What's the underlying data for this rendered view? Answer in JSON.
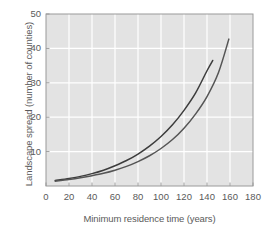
{
  "chart_data": {
    "type": "line",
    "title": "",
    "xlabel": "Minimum residence time (years)",
    "ylabel": "Landscape spread (number of counties)",
    "xlim": [
      0,
      180
    ],
    "ylim": [
      0,
      50
    ],
    "xticks": [
      0,
      20,
      40,
      60,
      80,
      100,
      120,
      140,
      160,
      180
    ],
    "yticks": [
      10,
      20,
      30,
      40,
      50
    ],
    "grid": true,
    "legend": "none",
    "background_color": "#e3e3e3",
    "gridline_color": "#ffffff",
    "axis_color": "#9a9a9a",
    "series": [
      {
        "name": "upper-curve",
        "color": "#3c3c3c",
        "x": [
          8,
          20,
          30,
          40,
          50,
          60,
          70,
          80,
          90,
          100,
          110,
          120,
          130,
          140,
          145
        ],
        "y": [
          1.6,
          2.2,
          2.8,
          3.6,
          4.6,
          5.9,
          7.4,
          9.3,
          11.6,
          14.4,
          17.8,
          22.0,
          27.0,
          33.5,
          36.5
        ]
      },
      {
        "name": "lower-curve",
        "color": "#555555",
        "x": [
          8,
          20,
          30,
          40,
          50,
          60,
          70,
          80,
          90,
          100,
          110,
          120,
          130,
          140,
          150,
          159
        ],
        "y": [
          1.4,
          1.9,
          2.4,
          3.0,
          3.7,
          4.6,
          5.7,
          7.1,
          8.8,
          10.9,
          13.5,
          16.8,
          20.9,
          26.0,
          33.0,
          42.7
        ]
      }
    ]
  },
  "axes": {
    "xlabel": "Minimum residence time (years)",
    "ylabel": "Landscape spread (number of counties)",
    "xtick_labels": [
      "0",
      "20",
      "40",
      "60",
      "80",
      "100",
      "120",
      "140",
      "160",
      "180"
    ],
    "ytick_labels": [
      "10",
      "20",
      "30",
      "40",
      "50"
    ]
  }
}
